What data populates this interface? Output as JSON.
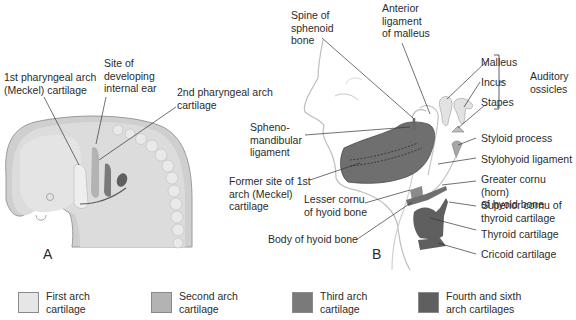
{
  "figure": {
    "panels": [
      {
        "id": "A",
        "label": "A"
      },
      {
        "id": "B",
        "label": "B"
      }
    ],
    "panel_a_labels": {
      "first_arch": "1st pharyngeal arch\n(Meckel) cartilage",
      "internal_ear": "Site of\ndeveloping\ninternal ear",
      "second_arch": "2nd pharyngeal arch\ncartilage"
    },
    "panel_b_labels": {
      "spine_sphenoid": "Spine of\nsphenoid\nbone",
      "anterior_ligament": "Anterior\nligament\nof malleus",
      "malleus": "Malleus",
      "incus": "Incus",
      "stapes": "Stapes",
      "auditory_ossicles": "Auditory\nossicles",
      "sphenomandibular": "Spheno-\nmandibular\nligament",
      "styloid": "Styloid process",
      "stylohyoid": "Stylohyoid ligament",
      "former_meckel": "Former site of 1st\narch (Meckel)\ncartilage",
      "greater_cornu": "Greater cornu (horn)\nof hyoid bone",
      "lesser_cornu": "Lesser cornu\nof hyoid bone",
      "superior_cornu": "Superior cornu of\nthyroid cartilage",
      "thyroid": "Thyroid cartilage",
      "body_hyoid": "Body of hyoid bone",
      "cricoid": "Cricoid cartilage"
    },
    "colors": {
      "first_arch": "#e6e6e6",
      "second_arch": "#b3b3b3",
      "third_arch": "#7a7a7a",
      "fourth_sixth_arch": "#5f5f5f",
      "skin": "#f5f5f5",
      "embryo": "#d9d9d9",
      "line": "#333333"
    }
  },
  "legend": {
    "items": [
      {
        "label": "First arch\ncartilage",
        "color": "#e6e6e6"
      },
      {
        "label": "Second arch\ncartilage",
        "color": "#b3b3b3"
      },
      {
        "label": "Third arch\ncartilage",
        "color": "#7a7a7a"
      },
      {
        "label": "Fourth and sixth\narch cartilages",
        "color": "#5f5f5f"
      }
    ]
  }
}
